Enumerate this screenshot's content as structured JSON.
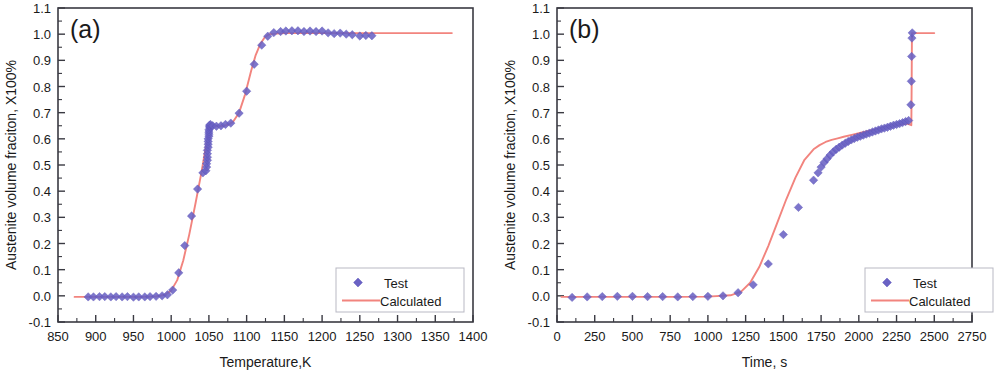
{
  "figure": {
    "background": "#ffffff",
    "series_colors": {
      "test_marker": "#6a62c4",
      "calculated_line": "#f2847e"
    }
  },
  "panels": [
    {
      "id": "a",
      "letter": "(a)",
      "legend": {
        "test_label": "Test",
        "calculated_label": "Calculated"
      }
    },
    {
      "id": "b",
      "letter": "(b)",
      "legend": {
        "test_label": "Test",
        "calculated_label": "Calculated"
      }
    }
  ],
  "chart_data": [
    {
      "type": "scatter",
      "title": "(a)",
      "xlabel": "Temperature,K",
      "ylabel": "Austenite volume fraciton, X100%",
      "xlim": [
        850,
        1400
      ],
      "ylim": [
        -0.1,
        1.1
      ],
      "xticks": [
        850,
        900,
        950,
        1000,
        1050,
        1100,
        1150,
        1200,
        1250,
        1300,
        1350,
        1400
      ],
      "yticks": [
        -0.1,
        0.0,
        0.1,
        0.2,
        0.3,
        0.4,
        0.5,
        0.6,
        0.7,
        0.8,
        0.9,
        1.0,
        1.1
      ],
      "xtick_labels": [
        "850",
        "900",
        "950",
        "1000",
        "1050",
        "1100",
        "1150",
        "1200",
        "1250",
        "1300",
        "1350",
        "1400"
      ],
      "ytick_labels": [
        "-0.1",
        "0.0",
        "0.1",
        "0.2",
        "0.3",
        "0.4",
        "0.5",
        "0.6",
        "0.7",
        "0.8",
        "0.9",
        "1.0",
        "1.1"
      ],
      "grid": false,
      "legend_position": "lower right",
      "series": [
        {
          "name": "Test",
          "marker": "diamond",
          "color": "#6a62c4",
          "x": [
            890,
            897,
            905,
            912,
            920,
            927,
            935,
            942,
            950,
            957,
            965,
            972,
            980,
            988,
            995,
            1002,
            1010,
            1018,
            1027,
            1035,
            1042,
            1046,
            1047,
            1047,
            1048,
            1048,
            1048,
            1048,
            1049,
            1049,
            1049,
            1049,
            1050,
            1050,
            1050,
            1050,
            1051,
            1051,
            1051,
            1052,
            1055,
            1060,
            1066,
            1072,
            1079,
            1090,
            1100,
            1110,
            1120,
            1128,
            1136,
            1145,
            1152,
            1160,
            1168,
            1176,
            1184,
            1192,
            1200,
            1208,
            1216,
            1224,
            1232,
            1240,
            1250,
            1258,
            1266
          ],
          "y": [
            -0.004,
            -0.004,
            -0.003,
            -0.003,
            -0.004,
            -0.003,
            -0.004,
            -0.003,
            -0.005,
            -0.004,
            -0.004,
            -0.003,
            -0.002,
            0.0,
            0.004,
            0.022,
            0.088,
            0.192,
            0.305,
            0.408,
            0.47,
            0.478,
            0.492,
            0.505,
            0.518,
            0.53,
            0.543,
            0.556,
            0.568,
            0.579,
            0.59,
            0.6,
            0.61,
            0.618,
            0.626,
            0.634,
            0.641,
            0.647,
            0.652,
            0.655,
            0.65,
            0.648,
            0.65,
            0.655,
            0.66,
            0.698,
            0.782,
            0.885,
            0.958,
            0.992,
            1.006,
            1.01,
            1.012,
            1.013,
            1.013,
            1.01,
            1.012,
            1.01,
            1.012,
            1.005,
            1.002,
            1.004,
            1.0,
            0.998,
            0.993,
            0.995,
            0.994
          ]
        },
        {
          "name": "Calculated",
          "type": "line",
          "color": "#f2847e",
          "x": [
            872,
            900,
            930,
            960,
            980,
            992,
            1000,
            1008,
            1016,
            1024,
            1032,
            1040,
            1046,
            1050,
            1054,
            1058,
            1064,
            1070,
            1076,
            1082,
            1090,
            1098,
            1106,
            1112,
            1118,
            1124,
            1130,
            1150,
            1200,
            1260,
            1320,
            1372
          ],
          "y": [
            -0.004,
            -0.004,
            -0.004,
            -0.004,
            -0.002,
            0.004,
            0.02,
            0.06,
            0.135,
            0.235,
            0.35,
            0.47,
            0.57,
            0.625,
            0.645,
            0.648,
            0.648,
            0.65,
            0.655,
            0.665,
            0.7,
            0.77,
            0.86,
            0.92,
            0.962,
            0.988,
            1.0,
            1.004,
            1.004,
            1.004,
            1.004,
            1.004
          ]
        }
      ]
    },
    {
      "type": "scatter",
      "title": "(b)",
      "xlabel": "Time, s",
      "ylabel": "Austenite volume fraciton, X100%",
      "xlim": [
        0,
        2750
      ],
      "ylim": [
        -0.1,
        1.1
      ],
      "xticks": [
        0,
        250,
        500,
        750,
        1000,
        1250,
        1500,
        1750,
        2000,
        2250,
        2500,
        2750
      ],
      "yticks": [
        -0.1,
        0.0,
        0.1,
        0.2,
        0.3,
        0.4,
        0.5,
        0.6,
        0.7,
        0.8,
        0.9,
        1.0,
        1.1
      ],
      "xtick_labels": [
        "0",
        "250",
        "500",
        "750",
        "1000",
        "1250",
        "1500",
        "1750",
        "2000",
        "2250",
        "2500",
        "2750"
      ],
      "ytick_labels": [
        "-0.1",
        "0.0",
        "0.1",
        "0.2",
        "0.3",
        "0.4",
        "0.5",
        "0.6",
        "0.7",
        "0.8",
        "0.9",
        "1.0",
        "1.1"
      ],
      "grid": false,
      "legend_position": "lower right",
      "series": [
        {
          "name": "Test",
          "marker": "diamond",
          "color": "#6a62c4",
          "x": [
            100,
            200,
            300,
            400,
            500,
            600,
            700,
            800,
            900,
            1000,
            1100,
            1200,
            1300,
            1400,
            1500,
            1600,
            1700,
            1730,
            1750,
            1770,
            1790,
            1810,
            1830,
            1850,
            1870,
            1890,
            1910,
            1930,
            1950,
            1970,
            1990,
            2010,
            2030,
            2050,
            2070,
            2090,
            2110,
            2130,
            2150,
            2170,
            2190,
            2210,
            2230,
            2250,
            2270,
            2290,
            2310,
            2330,
            2345,
            2348,
            2350,
            2352,
            2354
          ],
          "y": [
            -0.006,
            -0.004,
            -0.003,
            -0.002,
            -0.002,
            -0.003,
            -0.003,
            -0.004,
            -0.003,
            -0.002,
            0.0,
            0.012,
            0.042,
            0.122,
            0.234,
            0.338,
            0.442,
            0.47,
            0.492,
            0.51,
            0.524,
            0.538,
            0.55,
            0.56,
            0.568,
            0.576,
            0.583,
            0.59,
            0.596,
            0.601,
            0.606,
            0.61,
            0.614,
            0.618,
            0.622,
            0.626,
            0.63,
            0.634,
            0.638,
            0.641,
            0.644,
            0.648,
            0.652,
            0.655,
            0.658,
            0.662,
            0.666,
            0.67,
            0.73,
            0.82,
            0.915,
            0.985,
            1.005
          ]
        },
        {
          "name": "Calculated",
          "type": "line",
          "color": "#f2847e",
          "x": [
            30,
            200,
            400,
            600,
            800,
            1000,
            1150,
            1220,
            1280,
            1340,
            1400,
            1460,
            1520,
            1580,
            1640,
            1700,
            1740,
            1780,
            1820,
            1860,
            1900,
            1960,
            2020,
            2080,
            2140,
            2200,
            2260,
            2320,
            2348,
            2350,
            2352,
            2360,
            2420,
            2500
          ],
          "y": [
            -0.004,
            -0.004,
            -0.004,
            -0.004,
            -0.004,
            -0.003,
            0.002,
            0.016,
            0.05,
            0.11,
            0.19,
            0.28,
            0.37,
            0.452,
            0.52,
            0.56,
            0.576,
            0.588,
            0.596,
            0.602,
            0.608,
            0.616,
            0.624,
            0.632,
            0.64,
            0.648,
            0.654,
            0.658,
            0.652,
            0.8,
            1.004,
            1.004,
            1.004,
            1.004
          ]
        }
      ]
    }
  ]
}
